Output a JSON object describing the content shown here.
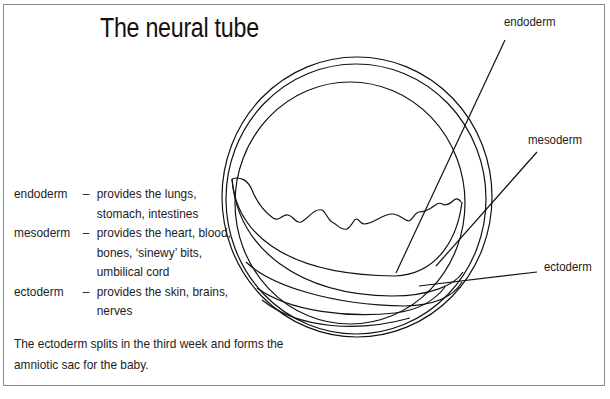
{
  "title": "The neural tube",
  "labels": {
    "endoderm": "endoderm",
    "mesoderm": "mesoderm",
    "ectoderm": "ectoderm"
  },
  "legend": [
    {
      "term": "endoderm",
      "dash": "–",
      "lines": [
        "provides the lungs,",
        "stomach, intestines"
      ]
    },
    {
      "term": "mesoderm",
      "dash": "–",
      "lines": [
        "provides the heart, blood,",
        "bones, ‘sinewy’ bits,",
        "umbilical cord"
      ]
    },
    {
      "term": "ectoderm",
      "dash": "–",
      "lines": [
        "provides the skin, brains,",
        "nerves"
      ]
    }
  ],
  "note": {
    "line1": "The ectoderm splits in the third week and forms the",
    "line2": "amniotic sac for the baby."
  },
  "colors": {
    "stroke": "#111111",
    "frame": "#8a8a8a",
    "background": "#ffffff"
  }
}
